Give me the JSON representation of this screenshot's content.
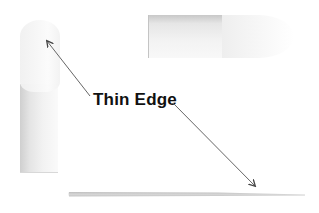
{
  "diagram": {
    "label": "Thin Edge",
    "elements": [
      {
        "name": "left-vertical-bar",
        "description": "Vertical cylindrical bar seen from the side, rounded pale top"
      },
      {
        "name": "top-horizontal-bar",
        "description": "Horizontal cylindrical bar with rounded lighter right end"
      },
      {
        "name": "bottom-thin-edge",
        "description": "Thin tapered flat edge near bottom"
      }
    ],
    "arrows": [
      {
        "name": "arrow-to-left-bar",
        "from": "label",
        "to": "left-vertical-bar",
        "direction": "up-left"
      },
      {
        "name": "arrow-to-bottom-edge",
        "from": "label",
        "to": "bottom-thin-edge",
        "direction": "down-right"
      }
    ],
    "colors": {
      "label_text": "#111111",
      "arrow": "#555555",
      "shape_gray": "#cccccc",
      "background": "#ffffff"
    }
  }
}
